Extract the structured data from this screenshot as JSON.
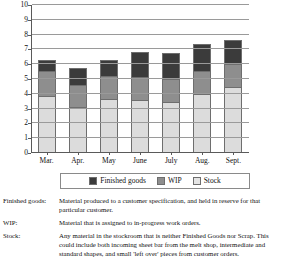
{
  "chart_data": {
    "type": "bar",
    "subtype": "stacked",
    "title": "",
    "xlabel": "",
    "ylabel": "",
    "categories": [
      "Mar.",
      "Apr.",
      "May",
      "June",
      "July",
      "Aug.",
      "Sept."
    ],
    "series": [
      {
        "name": "Stock",
        "values": [
          3.85,
          3.1,
          3.6,
          3.55,
          3.4,
          3.95,
          4.4
        ]
      },
      {
        "name": "WIP",
        "values": [
          1.65,
          1.5,
          1.6,
          1.55,
          1.6,
          1.6,
          1.6
        ]
      },
      {
        "name": "Finished goods",
        "values": [
          0.75,
          1.05,
          1.0,
          1.65,
          1.7,
          1.75,
          1.6
        ]
      }
    ],
    "totals": [
      6.25,
      5.65,
      6.2,
      6.75,
      6.7,
      7.3,
      7.6
    ],
    "ylim": [
      0,
      10
    ],
    "yticks": [
      0,
      1,
      2,
      3,
      4,
      5,
      6,
      7,
      8,
      9,
      10
    ],
    "ytick_labels": [
      "0",
      "1",
      "2",
      "3",
      "4",
      "5",
      "6",
      "7",
      "8",
      "9",
      "10"
    ],
    "grid": true,
    "grid_axis": "y",
    "legend_position": "bottom",
    "stack_order_bottom_to_top": [
      "Stock",
      "WIP",
      "Finished goods"
    ],
    "colors": {
      "finished_goods": "#3b3b3b",
      "wip": "#8e8e8e",
      "stock": "#dcdcdc",
      "axis": "#5a5a5a",
      "gridline": "#9a9a9a"
    }
  },
  "legend": {
    "entries": [
      {
        "label": "Finished goods",
        "swatch": "finished"
      },
      {
        "label": "WIP",
        "swatch": "wip"
      },
      {
        "label": "Stock",
        "swatch": "stock"
      }
    ]
  },
  "definitions": [
    {
      "term": "Finished goods:",
      "description": "Material produced to a customer specification, and held in reserve for that particular customer."
    },
    {
      "term": "WIP:",
      "description": "Material that is assigned to in-progress work orders."
    },
    {
      "term": "Stock:",
      "description": "Any material in the stockroom that is neither Finished Goods nor Scrap.  This could include both incoming sheet bar from the melt shop, intermediate and standard shapes, and small 'left over' pieces from customer orders."
    }
  ]
}
